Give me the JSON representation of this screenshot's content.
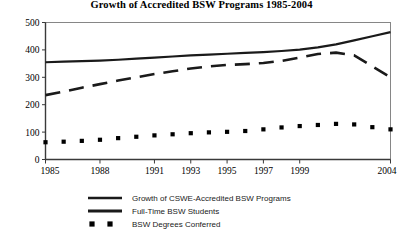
{
  "chart_data": {
    "type": "line",
    "title": "Growth of Accredited BSW Programs 1985-2004",
    "xlabel": "",
    "ylabel": "",
    "xlim": [
      1985,
      2004
    ],
    "ylim": [
      0,
      500
    ],
    "yticks": [
      0,
      100,
      200,
      300,
      400,
      500
    ],
    "xticks": [
      1985,
      1988,
      1991,
      1993,
      1995,
      1997,
      1999,
      2004
    ],
    "xtick_labels": [
      "1985",
      "1988",
      "1991",
      "1993",
      "1995",
      "1997",
      "1999",
      "2004"
    ],
    "ytick_labels": [
      "0",
      "100",
      "200",
      "300",
      "400",
      "500"
    ],
    "grid": false,
    "legend_position": "bottom",
    "x": [
      1985,
      1986,
      1987,
      1988,
      1989,
      1990,
      1991,
      1992,
      1993,
      1994,
      1995,
      1996,
      1997,
      1998,
      1999,
      2000,
      2001,
      2002,
      2003,
      2004
    ],
    "series": [
      {
        "name": "Growth of CSWE-Accredited BSW Programs",
        "style": "solid",
        "color": "#1a1a1a",
        "values": [
          355,
          357,
          359,
          361,
          364,
          368,
          372,
          376,
          380,
          383,
          386,
          389,
          392,
          396,
          401,
          409,
          420,
          435,
          450,
          465
        ]
      },
      {
        "name": "Full-Time BSW Students",
        "style": "dashed",
        "color": "#1a1a1a",
        "values": [
          235,
          248,
          262,
          275,
          288,
          300,
          312,
          322,
          332,
          340,
          345,
          348,
          352,
          360,
          372,
          385,
          390,
          380,
          340,
          300
        ]
      },
      {
        "name": "BSW Degrees Conferred",
        "style": "dotted-squares",
        "color": "#000000",
        "values": [
          63,
          65,
          68,
          72,
          78,
          83,
          88,
          92,
          96,
          99,
          101,
          104,
          110,
          117,
          122,
          126,
          130,
          128,
          118,
          110
        ]
      }
    ],
    "legend": [
      {
        "label": "Growth of CSWE-Accredited BSW Programs",
        "marker": "solid-line"
      },
      {
        "label": "Full-Time BSW Students",
        "marker": "solid-line"
      },
      {
        "label": "BSW Degrees Conferred",
        "marker": "square-dots"
      }
    ]
  }
}
